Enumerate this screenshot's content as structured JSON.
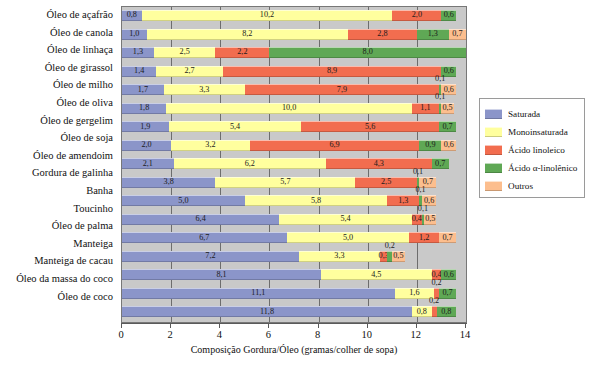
{
  "chart_data": {
    "type": "bar",
    "orientation": "horizontal",
    "stacked": true,
    "title": "",
    "xlabel": "Composição Gordura/Óleo (gramas/colher de sopa)",
    "ylabel": "",
    "xlim": [
      0,
      14
    ],
    "xticks": [
      0,
      2,
      4,
      6,
      8,
      10,
      12,
      14
    ],
    "xticklabels": [
      "0",
      "2",
      "4",
      "6",
      "8",
      "10",
      "12",
      "14"
    ],
    "grid": true,
    "grid_axis": "x",
    "legend_position": "right",
    "plot_background": "#c9c9c9",
    "series": [
      {
        "name": "Saturada",
        "color": "#8b95c9",
        "values": [
          0.8,
          1.0,
          1.3,
          1.4,
          1.7,
          1.8,
          1.9,
          2.0,
          2.1,
          3.8,
          5.0,
          6.4,
          6.7,
          7.2,
          8.1,
          11.1,
          11.8
        ]
      },
      {
        "name": "Monoinsaturada",
        "color": "#ffff9e",
        "values": [
          10.2,
          8.2,
          2.5,
          2.7,
          3.3,
          10.0,
          5.4,
          3.2,
          6.2,
          5.7,
          5.8,
          5.4,
          5.0,
          3.3,
          4.5,
          1.6,
          0.8
        ]
      },
      {
        "name": "Ácido linoleico",
        "color": "#f26d4f",
        "values": [
          2.0,
          2.8,
          2.2,
          8.9,
          7.9,
          1.1,
          5.6,
          6.9,
          4.3,
          2.5,
          1.3,
          0.4,
          1.2,
          0.3,
          0.4,
          0.2,
          0.2
        ]
      },
      {
        "name": "Ácido α-linolênico",
        "color": "#5fa855",
        "values": [
          0.6,
          1.3,
          8.0,
          0.6,
          0.1,
          0.1,
          0.7,
          0.9,
          0.1,
          0.1,
          0.1,
          0.1,
          0.0,
          0.2,
          0.6,
          0.7,
          0.8
        ]
      },
      {
        "name": "Outros",
        "color": "#fcbe8e",
        "values": [
          0.0,
          0.7,
          0.0,
          0.0,
          0.6,
          0.5,
          0.0,
          0.6,
          0.7,
          0.7,
          0.6,
          0.5,
          0.7,
          0.5,
          0.0,
          0.0,
          0.0
        ]
      }
    ],
    "categories": [
      "Óleo de açafrão",
      "Óleo de canola",
      "Óleo de linhaça",
      "Óleo de girassol",
      "Óleo de milho",
      "Óleo de oliva",
      "Óleo de gergelim",
      "Óleo de soja",
      "Óleo de amendoim",
      "Gordura de galinha",
      "Banha",
      "Toucinho",
      "Óleo de palma",
      "Manteiga",
      "Manteiga de cacau",
      "Óleo da massa do coco",
      "Óleo de coco"
    ],
    "rows": [
      {
        "label": "Óleo de açafrão",
        "segments": [
          {
            "series": "Saturada",
            "value": 0.8,
            "text": "0,8"
          },
          {
            "series": "Monoinsaturada",
            "value": 10.2,
            "text": "10,2"
          },
          {
            "series": "Ácido linoleico",
            "value": 2.0,
            "text": "2,0"
          },
          {
            "series": "Ácido α-linolênico",
            "value": 0.6,
            "text": "0,6"
          }
        ]
      },
      {
        "label": "Óleo de canola",
        "segments": [
          {
            "series": "Saturada",
            "value": 1.0,
            "text": "1,0"
          },
          {
            "series": "Monoinsaturada",
            "value": 8.2,
            "text": "8,2"
          },
          {
            "series": "Ácido linoleico",
            "value": 2.8,
            "text": "2,8"
          },
          {
            "series": "Ácido α-linolênico",
            "value": 1.3,
            "text": "1,3"
          },
          {
            "series": "Outros",
            "value": 0.7,
            "text": "0,7"
          }
        ]
      },
      {
        "label": "Óleo de linhaça",
        "segments": [
          {
            "series": "Saturada",
            "value": 1.3,
            "text": "1,3"
          },
          {
            "series": "Monoinsaturada",
            "value": 2.5,
            "text": "2,5"
          },
          {
            "series": "Ácido linoleico",
            "value": 2.2,
            "text": "2,2"
          },
          {
            "series": "Ácido α-linolênico",
            "value": 8.0,
            "text": "8,0"
          }
        ]
      },
      {
        "label": "Óleo de girassol",
        "segments": [
          {
            "series": "Saturada",
            "value": 1.4,
            "text": "1,4"
          },
          {
            "series": "Monoinsaturada",
            "value": 2.7,
            "text": "2,7"
          },
          {
            "series": "Ácido linoleico",
            "value": 8.9,
            "text": "8,9"
          },
          {
            "series": "Ácido α-linolênico",
            "value": 0.6,
            "text": "0,6"
          }
        ]
      },
      {
        "label": "Óleo de milho",
        "segments": [
          {
            "series": "Saturada",
            "value": 1.7,
            "text": "1,7"
          },
          {
            "series": "Monoinsaturada",
            "value": 3.3,
            "text": "3,3"
          },
          {
            "series": "Ácido linoleico",
            "value": 7.9,
            "text": "7,9"
          },
          {
            "series": "Ácido α-linolênico",
            "value": 0.1,
            "text": "0,1",
            "outside": true
          },
          {
            "series": "Outros",
            "value": 0.6,
            "text": "0,6"
          }
        ]
      },
      {
        "label": "Óleo de oliva",
        "segments": [
          {
            "series": "Saturada",
            "value": 1.8,
            "text": "1,8"
          },
          {
            "series": "Monoinsaturada",
            "value": 10.0,
            "text": "10,0"
          },
          {
            "series": "Ácido linoleico",
            "value": 1.1,
            "text": "1,1"
          },
          {
            "series": "Ácido α-linolênico",
            "value": 0.1,
            "text": "0,1",
            "outside": true
          },
          {
            "series": "Outros",
            "value": 0.5,
            "text": "0,5"
          }
        ]
      },
      {
        "label": "Óleo de gergelim",
        "segments": [
          {
            "series": "Saturada",
            "value": 1.9,
            "text": "1,9"
          },
          {
            "series": "Monoinsaturada",
            "value": 5.4,
            "text": "5,4"
          },
          {
            "series": "Ácido linoleico",
            "value": 5.6,
            "text": "5,6"
          },
          {
            "series": "Ácido α-linolênico",
            "value": 0.7,
            "text": "0,7"
          }
        ]
      },
      {
        "label": "Óleo de soja",
        "segments": [
          {
            "series": "Saturada",
            "value": 2.0,
            "text": "2,0"
          },
          {
            "series": "Monoinsaturada",
            "value": 3.2,
            "text": "3,2"
          },
          {
            "series": "Ácido linoleico",
            "value": 6.9,
            "text": "6,9"
          },
          {
            "series": "Ácido α-linolênico",
            "value": 0.9,
            "text": "0,9"
          },
          {
            "series": "Outros",
            "value": 0.6,
            "text": "0,6"
          }
        ]
      },
      {
        "label": "Óleo de amendoim",
        "segments": [
          {
            "series": "Saturada",
            "value": 2.1,
            "text": "2,1"
          },
          {
            "series": "Monoinsaturada",
            "value": 6.2,
            "text": "6,2"
          },
          {
            "series": "Ácido linoleico",
            "value": 4.3,
            "text": "4,3"
          },
          {
            "series": "Ácido α-linolênico",
            "value": 0.7,
            "text": "0,7"
          }
        ]
      },
      {
        "label": "Gordura de galinha",
        "segments": [
          {
            "series": "Saturada",
            "value": 3.8,
            "text": "3,8"
          },
          {
            "series": "Monoinsaturada",
            "value": 5.7,
            "text": "5,7"
          },
          {
            "series": "Ácido linoleico",
            "value": 2.5,
            "text": "2,5"
          },
          {
            "series": "Ácido α-linolênico",
            "value": 0.1,
            "text": "0,1",
            "outside": true
          },
          {
            "series": "Outros",
            "value": 0.7,
            "text": "0,7"
          }
        ]
      },
      {
        "label": "Banha",
        "segments": [
          {
            "series": "Saturada",
            "value": 5.0,
            "text": "5,0"
          },
          {
            "series": "Monoinsaturada",
            "value": 5.8,
            "text": "5,8"
          },
          {
            "series": "Ácido linoleico",
            "value": 1.3,
            "text": "1,3"
          },
          {
            "series": "Ácido α-linolênico",
            "value": 0.1,
            "text": "0,1",
            "outside": true
          },
          {
            "series": "Outros",
            "value": 0.6,
            "text": "0,6"
          }
        ]
      },
      {
        "label": "Toucinho",
        "segments": [
          {
            "series": "Saturada",
            "value": 6.4,
            "text": "6,4"
          },
          {
            "series": "Monoinsaturada",
            "value": 5.4,
            "text": "5,4"
          },
          {
            "series": "Ácido linoleico",
            "value": 0.4,
            "text": "0,4"
          },
          {
            "series": "Ácido α-linolênico",
            "value": 0.1,
            "text": "0,1",
            "outside": true
          },
          {
            "series": "Outros",
            "value": 0.5,
            "text": "0,5"
          }
        ]
      },
      {
        "label": "Óleo de palma",
        "segments": [
          {
            "series": "Saturada",
            "value": 6.7,
            "text": "6,7"
          },
          {
            "series": "Monoinsaturada",
            "value": 5.0,
            "text": "5,0"
          },
          {
            "series": "Ácido linoleico",
            "value": 1.2,
            "text": "1,2"
          },
          {
            "series": "Outros",
            "value": 0.7,
            "text": "0,7"
          }
        ]
      },
      {
        "label": "Manteiga",
        "segments": [
          {
            "series": "Saturada",
            "value": 7.2,
            "text": "7,2"
          },
          {
            "series": "Monoinsaturada",
            "value": 3.3,
            "text": "3,3"
          },
          {
            "series": "Ácido linoleico",
            "value": 0.3,
            "text": "0,3"
          },
          {
            "series": "Ácido α-linolênico",
            "value": 0.2,
            "text": "0,2",
            "outside": true
          },
          {
            "series": "Outros",
            "value": 0.5,
            "text": "0,5"
          }
        ]
      },
      {
        "label": "Manteiga de cacau",
        "segments": [
          {
            "series": "Saturada",
            "value": 8.1,
            "text": "8,1"
          },
          {
            "series": "Monoinsaturada",
            "value": 4.5,
            "text": "4,5"
          },
          {
            "series": "Ácido linoleico",
            "value": 0.4,
            "text": "0,4"
          },
          {
            "series": "Ácido α-linolênico",
            "value": 0.6,
            "text": "0,6"
          }
        ]
      },
      {
        "label": "Óleo da massa do coco",
        "segments": [
          {
            "series": "Saturada",
            "value": 11.1,
            "text": "11,1"
          },
          {
            "series": "Monoinsaturada",
            "value": 1.6,
            "text": "1,6"
          },
          {
            "series": "Ácido linoleico",
            "value": 0.2,
            "text": "0,2",
            "outside": true
          },
          {
            "series": "Ácido α-linolênico",
            "value": 0.7,
            "text": "0,7"
          }
        ]
      },
      {
        "label": "Óleo de coco",
        "segments": [
          {
            "series": "Saturada",
            "value": 11.8,
            "text": "11,8"
          },
          {
            "series": "Monoinsaturada",
            "value": 0.8,
            "text": "0,8"
          },
          {
            "series": "Ácido linoleico",
            "value": 0.2,
            "text": "0,2",
            "outside": true
          },
          {
            "series": "Ácido α-linolênico",
            "value": 0.8,
            "text": "0,8"
          }
        ]
      }
    ],
    "legend": [
      {
        "label": "Saturada",
        "color": "#8b95c9"
      },
      {
        "label": "Monoinsaturada",
        "color": "#ffff9e"
      },
      {
        "label": "Ácido linoleico",
        "color": "#f26d4f"
      },
      {
        "label": "Ácido α-linolênico",
        "color": "#5fa855"
      },
      {
        "label": "Outros",
        "color": "#fcbe8e"
      }
    ]
  }
}
